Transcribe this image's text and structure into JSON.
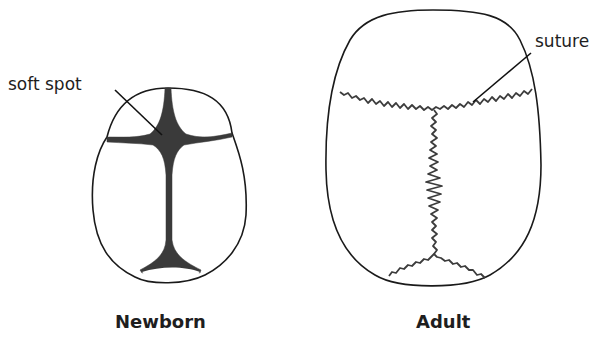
{
  "figures": [
    {
      "id": "newborn",
      "caption": "Newborn",
      "callout": "soft spot"
    },
    {
      "id": "adult",
      "caption": "Adult",
      "callout": "suture"
    }
  ],
  "colors": {
    "outline": "#1a1a1a",
    "fontanelle_fill": "#3a3a3a",
    "suture": "#3c3c3c",
    "text": "#1e1e1e",
    "background": "#ffffff"
  }
}
